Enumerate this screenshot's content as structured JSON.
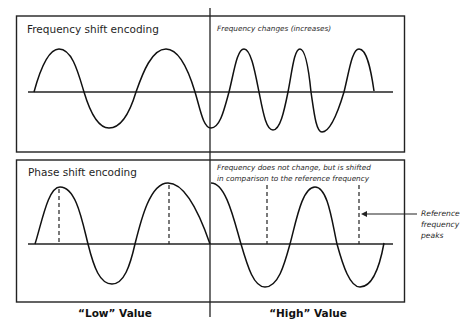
{
  "top_panel": {
    "title": "Frequency shift encoding",
    "note": "Frequency changes (increases)"
  },
  "bottom_panel": {
    "title": "Phase shift encoding",
    "note_line1": "Frequency does not change, but is shifted",
    "note_line2": "in comparison to the reference frequency"
  },
  "annotation": {
    "line1": "Reference",
    "line2": "frequency",
    "line3": "peaks"
  },
  "labels": {
    "low": "“Low” Value",
    "high": "“High” Value"
  },
  "colors": {
    "line": "#111111",
    "background": "#ffffff"
  }
}
